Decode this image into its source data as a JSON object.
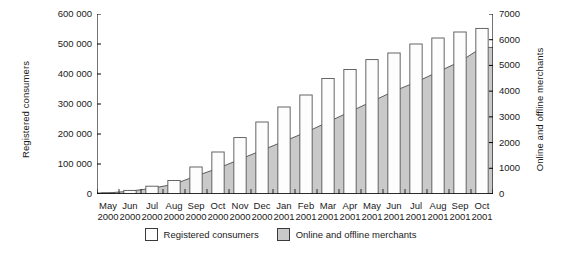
{
  "chart_data": {
    "type": "bar",
    "title": "",
    "subtitle": "",
    "xlabel": "",
    "ylabel": "Registered consumers",
    "y2label": "Online and offline merchants",
    "grid": false,
    "legend_position": "bottom-center",
    "ylim": [
      0,
      600000
    ],
    "y2lim": [
      0,
      7000
    ],
    "yticks": [
      0,
      100000,
      200000,
      300000,
      400000,
      500000,
      600000
    ],
    "ytick_labels": [
      "0",
      "100 000",
      "200 000",
      "300 000",
      "400 000",
      "500 000",
      "600 000"
    ],
    "y2ticks": [
      0,
      1000,
      2000,
      3000,
      4000,
      5000,
      6000,
      7000
    ],
    "y2tick_labels": [
      "0",
      "1000",
      "2000",
      "3000",
      "4000",
      "5000",
      "6000",
      "7000"
    ],
    "categories": [
      "May 2000",
      "Jun 2000",
      "Jul 2000",
      "Aug 2000",
      "Sep 2000",
      "Oct 2000",
      "Nov 2000",
      "Dec 2000",
      "Jan 2001",
      "Feb 2001",
      "Mar 2001",
      "Apr 2001",
      "May 2001",
      "Jun 2001",
      "Jul 2001",
      "Aug 2001",
      "Sep 2001",
      "Oct 2001"
    ],
    "category_months": [
      "May",
      "Jun",
      "Jul",
      "Aug",
      "Sep",
      "Oct",
      "Nov",
      "Dec",
      "Jan",
      "Feb",
      "Mar",
      "Apr",
      "May",
      "Jun",
      "Jul",
      "Aug",
      "Sep",
      "Oct"
    ],
    "category_years": [
      "2000",
      "2000",
      "2000",
      "2000",
      "2000",
      "2000",
      "2000",
      "2000",
      "2001",
      "2001",
      "2001",
      "2001",
      "2001",
      "2001",
      "2001",
      "2001",
      "2001",
      "2001"
    ],
    "series": [
      {
        "name": "Registered consumers",
        "axis": "left",
        "render": "bar",
        "color": "#fdfdfd",
        "edge_color": "#555555",
        "values": [
          4000,
          12000,
          26000,
          45000,
          90000,
          140000,
          188000,
          240000,
          290000,
          330000,
          385000,
          415000,
          448000,
          470000,
          500000,
          520000,
          540000,
          552000
        ]
      },
      {
        "name": "Online and offline merchants",
        "axis": "right",
        "render": "area",
        "color": "#c9c9c9",
        "edge_color": "#4d4d4d",
        "values": [
          40,
          110,
          220,
          380,
          700,
          1000,
          1350,
          1700,
          2050,
          2400,
          2800,
          3200,
          3600,
          4000,
          4350,
          4750,
          5150,
          5700
        ]
      }
    ]
  },
  "legend": {
    "items": [
      {
        "label": "Registered consumers",
        "swatch": "white-square-icon"
      },
      {
        "label": "Online and offline merchants",
        "swatch": "gray-square-icon"
      }
    ]
  }
}
